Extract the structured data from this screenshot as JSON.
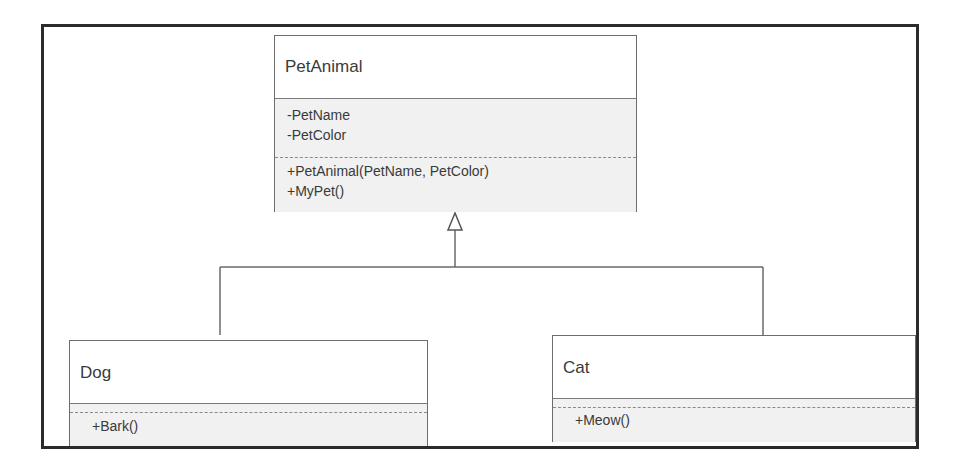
{
  "diagram": {
    "type": "UML class diagram",
    "relationship": "generalization",
    "classes": {
      "parent": {
        "name": "PetAnimal",
        "attributes": [
          "-PetName",
          "-PetColor"
        ],
        "operations": [
          "+PetAnimal(PetName, PetColor)",
          "+MyPet()"
        ]
      },
      "dog": {
        "name": "Dog",
        "attributes": [],
        "operations": [
          "+Bark()"
        ]
      },
      "cat": {
        "name": "Cat",
        "attributes": [],
        "operations": [
          "+Meow()"
        ]
      }
    },
    "edges": [
      {
        "from": "Dog",
        "to": "PetAnimal",
        "kind": "inheritance"
      },
      {
        "from": "Cat",
        "to": "PetAnimal",
        "kind": "inheritance"
      }
    ],
    "colors": {
      "frame": "#2b2b2b",
      "box_border": "#6d6d6d",
      "section_fill": "#f1f1f1",
      "line": "#6a6a6a"
    }
  }
}
